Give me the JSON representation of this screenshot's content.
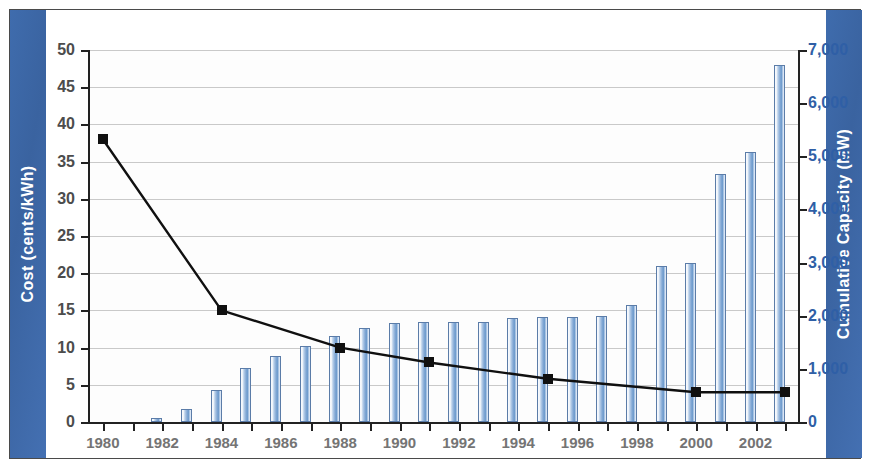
{
  "figure": {
    "left_axis_title": "Cost (cents/kWh)",
    "right_axis_title": "Cumulative Capacity (MW)",
    "accent_blue": "#3f6cad",
    "bar_fill": "#7fa6d4",
    "line_color": "#101010"
  },
  "chart_data": {
    "type": "bar",
    "title": "",
    "subtitle": "",
    "xlabel": "",
    "ylabel": "Cost (cents/kWh)",
    "y2label": "Cumulative Capacity (MW)",
    "grid": true,
    "legend": "none",
    "x": [
      1980,
      1981,
      1982,
      1983,
      1984,
      1985,
      1986,
      1987,
      1988,
      1989,
      1990,
      1991,
      1992,
      1993,
      1994,
      1995,
      1996,
      1997,
      1998,
      1999,
      2000,
      2001,
      2002,
      2003
    ],
    "xlim": [
      1979.5,
      2003.5
    ],
    "xtick_labels": [
      "1980",
      "1982",
      "1984",
      "1986",
      "1988",
      "1990",
      "1992",
      "1994",
      "1996",
      "1998",
      "2000",
      "2002"
    ],
    "xticks": [
      1980,
      1982,
      1984,
      1986,
      1988,
      1990,
      1992,
      1994,
      1996,
      1998,
      2000,
      2002
    ],
    "ylim": [
      0,
      50
    ],
    "yticks": [
      0,
      5,
      10,
      15,
      20,
      25,
      30,
      35,
      40,
      45,
      50
    ],
    "ytick_labels": [
      "0",
      "5",
      "10",
      "15",
      "20",
      "25",
      "30",
      "35",
      "40",
      "45",
      "50"
    ],
    "y2lim": [
      0,
      7000
    ],
    "y2ticks": [
      0,
      1000,
      2000,
      3000,
      4000,
      5000,
      6000,
      7000
    ],
    "y2tick_labels": [
      "0",
      "1,000",
      "2,000",
      "3,000",
      "4,000",
      "5,000",
      "6,000",
      "7,000"
    ],
    "series": [
      {
        "name": "Cumulative Capacity (MW)",
        "type": "bar",
        "axis": "right",
        "units": "MW",
        "values": [
          0,
          0,
          70,
          240,
          610,
          1010,
          1250,
          1430,
          1620,
          1770,
          1870,
          1890,
          1890,
          1880,
          1950,
          1980,
          1970,
          2000,
          2200,
          2930,
          2990,
          4660,
          5080,
          6710
        ]
      },
      {
        "name": "Cost (cents/kWh)",
        "type": "line",
        "axis": "left",
        "units": "cents/kWh",
        "marker": "square",
        "x": [
          1980,
          1984,
          1988,
          1991,
          1995,
          2000,
          2003
        ],
        "values": [
          38,
          15,
          10,
          8,
          5.8,
          4,
          4
        ]
      }
    ]
  }
}
